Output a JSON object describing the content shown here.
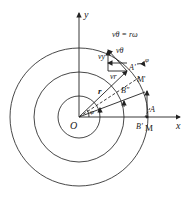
{
  "diagram": {
    "title_formula": "vθ = rω",
    "labels": {
      "y_axis": "y",
      "x_axis": "x",
      "origin": "O",
      "radius": "r",
      "v_theta": "vθ",
      "v_y": "vy",
      "v_r": "vr",
      "A_prime": "A'",
      "M_prime": "M'",
      "B_dprime": "B''",
      "A": "A",
      "B_prime": "B'",
      "M": "M",
      "phi": "φ",
      "omega_angle": "φ"
    },
    "stroke_color": "#333333"
  }
}
